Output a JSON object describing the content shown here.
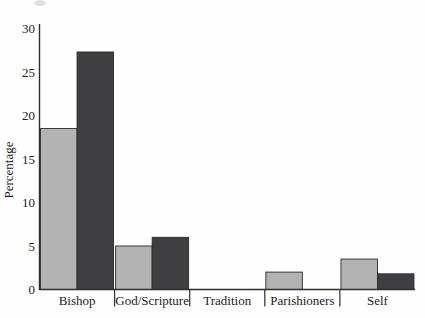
{
  "figure": {
    "background": "#fefefe",
    "text_color": "#1c1c1c",
    "axis_color": "#2e2e2e"
  },
  "chart_data": {
    "type": "bar",
    "title": "",
    "xlabel": "",
    "ylabel": "Percentage",
    "categories": [
      "Bishop",
      "God/Scripture",
      "Tradition",
      "Parishioners",
      "Self"
    ],
    "series": [
      {
        "name": "light-gray-series",
        "color": "#b3b3b3",
        "values": [
          18.5,
          5,
          0,
          2,
          3.5
        ]
      },
      {
        "name": "dark-gray-series",
        "color": "#3f3f41",
        "values": [
          27.3,
          6,
          0,
          0,
          1.8
        ]
      }
    ],
    "y_ticks": [
      0,
      5,
      10,
      15,
      20,
      25,
      30
    ],
    "ylim": [
      0,
      30
    ],
    "grid": false,
    "legend": "none",
    "bar_border_color": "#2a2a2a"
  }
}
